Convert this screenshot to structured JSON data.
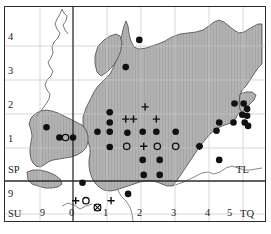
{
  "figure": {
    "type": "distribution-map",
    "width": 271,
    "height": 234,
    "background_color": "#ffffff",
    "frame_color": "#2b2b2b",
    "land_fill_color": "#b0b0b0",
    "land_hatch_color": "#9a9a9a",
    "coastline_color": "#4a4a4a",
    "gridline_minor_color": "#c9c9c9",
    "gridline_major_color": "#333333",
    "symbol_color": "#111111"
  },
  "axes": {
    "x_ticks": [
      "0",
      "1",
      "2",
      "3",
      "4",
      "5"
    ],
    "y_ticks": [
      "1",
      "2",
      "3",
      "4"
    ],
    "x_extra_label": "TQ",
    "y_extra_label": "9",
    "x_left_label": "9"
  },
  "grid_squares": {
    "top_left": "SP",
    "bottom_left": "SU",
    "right_middle": "TL",
    "bottom_right": "TQ"
  },
  "chart_data": {
    "type": "scatter",
    "title": "",
    "xlabel": "",
    "ylabel": "",
    "xlim": [
      -1.35,
      5.6
    ],
    "ylim": [
      -1.25,
      4.75
    ],
    "grid": true,
    "legend_position": "none",
    "series": [
      {
        "name": "filled-circle",
        "marker": "filled-circle",
        "points": [
          [
            1.95,
            4.15
          ],
          [
            1.55,
            3.35
          ],
          [
            4.75,
            2.28
          ],
          [
            5.02,
            2.28
          ],
          [
            5.12,
            2.12
          ],
          [
            4.98,
            1.95
          ],
          [
            5.12,
            1.92
          ],
          [
            5.05,
            1.72
          ],
          [
            5.15,
            1.62
          ],
          [
            4.3,
            1.72
          ],
          [
            4.72,
            1.72
          ],
          [
            1.08,
            2.02
          ],
          [
            1.08,
            1.72
          ],
          [
            0.72,
            1.45
          ],
          [
            1.08,
            1.45
          ],
          [
            2.05,
            1.45
          ],
          [
            2.45,
            1.45
          ],
          [
            3.02,
            1.45
          ],
          [
            1.6,
            1.42
          ],
          [
            4.22,
            1.48
          ],
          [
            3.72,
            1.02
          ],
          [
            1.08,
            1.0
          ],
          [
            4.3,
            0.62
          ],
          [
            2.05,
            0.62
          ],
          [
            2.55,
            0.62
          ],
          [
            2.08,
            0.18
          ],
          [
            2.55,
            0.18
          ],
          [
            0.28,
            -0.05
          ],
          [
            1.62,
            -0.38
          ],
          [
            -0.78,
            1.58
          ],
          [
            -0.4,
            1.28
          ],
          [
            0.0,
            1.28
          ]
        ]
      },
      {
        "name": "open-circle",
        "marker": "open-circle",
        "points": [
          [
            -0.22,
            1.28
          ],
          [
            1.58,
            1.02
          ],
          [
            3.02,
            1.02
          ],
          [
            2.48,
            1.02
          ],
          [
            0.38,
            -0.58
          ]
        ]
      },
      {
        "name": "plus",
        "marker": "plus",
        "points": [
          [
            2.12,
            2.18
          ],
          [
            1.55,
            1.82
          ],
          [
            1.78,
            1.82
          ],
          [
            2.45,
            1.82
          ],
          [
            2.08,
            1.02
          ],
          [
            3.72,
            1.02
          ],
          [
            0.08,
            -0.58
          ],
          [
            1.12,
            -0.58
          ]
        ]
      },
      {
        "name": "crossed-circle",
        "marker": "crossed-circle",
        "points": [
          [
            0.72,
            -0.78
          ]
        ]
      }
    ]
  }
}
